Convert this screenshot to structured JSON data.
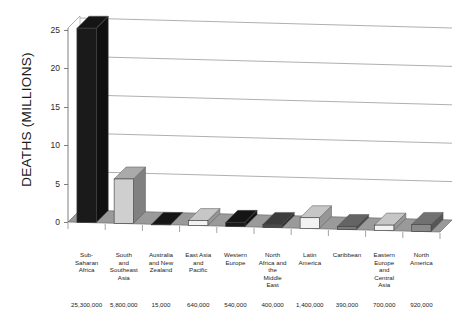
{
  "chart_data": {
    "type": "bar",
    "title": "",
    "xlabel": "",
    "ylabel": "DEATHS (MILLIONS)",
    "ylim": [
      0,
      25
    ],
    "ytick_labels": [
      "0",
      "5",
      "10",
      "15",
      "20",
      "25"
    ],
    "ytick_values": [
      0,
      5,
      10,
      15,
      20,
      25
    ],
    "grid": true,
    "legend": "none",
    "style": "3d-bar",
    "categories": [
      "Sub-\nSaharan\nAfrica",
      "South\nand\nSoutheast\nAsia",
      "Australia\nand New\nZealand",
      "East Asia\nand\nPacific",
      "Western\nEurope",
      "North\nAfrica and\nthe\nMiddle\nEast",
      "Latin\nAmerica",
      "Caribbean",
      "Eastern\nEurope\nand\nCentral\nAsia",
      "North\nAmerica"
    ],
    "value_labels": [
      "25,300,000",
      "5,800,000",
      "15,000",
      "640,000",
      "540,000",
      "400,000",
      "1,400,000",
      "390,000",
      "700,000",
      "920,000"
    ],
    "values": [
      25300000,
      5800000,
      15000,
      640000,
      540000,
      400000,
      1400000,
      390000,
      700000,
      920000
    ],
    "values_millions": [
      25.3,
      5.8,
      0.015,
      0.64,
      0.54,
      0.4,
      1.4,
      0.39,
      0.7,
      0.92
    ],
    "bar_colors": [
      "#1a1a1a",
      "#cfcfcf",
      "#1a1a1a",
      "#f2f2f2",
      "#1a1a1a",
      "#4a4a4a",
      "#f2f2f2",
      "#7a7a7a",
      "#f2f2f2",
      "#8a8a8a"
    ],
    "floor_color": "#9a9a9a",
    "gridline_color": "#8c8c8c"
  }
}
